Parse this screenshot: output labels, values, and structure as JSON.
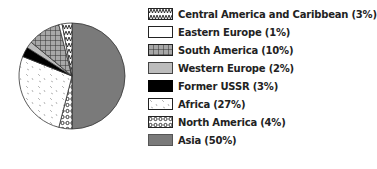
{
  "chart_data": {
    "type": "pie",
    "title": "",
    "start_angle": "12 o'clock, clockwise",
    "slices": [
      {
        "label": "Asia",
        "value": 50,
        "fill": "#7a7a7a",
        "pattern": "solid"
      },
      {
        "label": "North America",
        "value": 4,
        "fill": "#ffffff",
        "pattern": "circles"
      },
      {
        "label": "Africa",
        "value": 27,
        "fill": "#ffffff",
        "pattern": "dashes"
      },
      {
        "label": "Former USSR",
        "value": 3,
        "fill": "#000000",
        "pattern": "solid"
      },
      {
        "label": "Western Europe",
        "value": 2,
        "fill": "#bcbcbc",
        "pattern": "solid"
      },
      {
        "label": "South America",
        "value": 10,
        "fill": "#9a9a9a",
        "pattern": "grid"
      },
      {
        "label": "Eastern Europe",
        "value": 1,
        "fill": "#ffffff",
        "pattern": "solid"
      },
      {
        "label": "Central America and Caribbean",
        "value": 3,
        "fill": "#ffffff",
        "pattern": "wave"
      }
    ],
    "legend_position": "right"
  },
  "legend": [
    {
      "label": "Central America and Caribbean (3%)",
      "pattern": "wave"
    },
    {
      "label": "Eastern Europe (1%)",
      "pattern": "white"
    },
    {
      "label": "South America (10%)",
      "pattern": "grid"
    },
    {
      "label": "Western Europe (2%)",
      "pattern": "lightgray"
    },
    {
      "label": "Former USSR (3%)",
      "pattern": "black"
    },
    {
      "label": "Africa (27%)",
      "pattern": "dashes"
    },
    {
      "label": "North America (4%)",
      "pattern": "circles"
    },
    {
      "label": "Asia (50%)",
      "pattern": "darkgray"
    }
  ]
}
